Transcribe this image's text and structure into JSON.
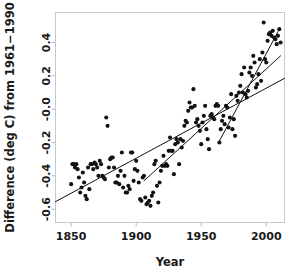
{
  "chart_data": {
    "type": "scatter",
    "title": "",
    "xlabel": "Year",
    "ylabel": "Difference (deg C) from 1961–1990",
    "xlim": [
      1838,
      2014
    ],
    "ylim": [
      -0.68,
      0.58
    ],
    "grid": false,
    "legend": "none",
    "xticks": [
      1850,
      1900,
      1950,
      2000
    ],
    "xtick_labels": [
      "1850",
      "1900",
      "1950",
      "2000"
    ],
    "yticks": [
      -0.6,
      -0.4,
      -0.2,
      -0.0,
      0.2,
      0.4
    ],
    "ytick_labels": [
      "-0.6",
      "-0.4",
      "-0.2",
      "-0.0",
      "0.2",
      "0.4"
    ],
    "point_color": "#121212",
    "line_color": "#121212",
    "series": [
      {
        "name": "Annual temperature anomaly",
        "x": [
          1850,
          1851,
          1852,
          1853,
          1854,
          1855,
          1856,
          1857,
          1858,
          1859,
          1860,
          1861,
          1862,
          1863,
          1864,
          1865,
          1866,
          1867,
          1868,
          1869,
          1870,
          1871,
          1872,
          1873,
          1874,
          1875,
          1876,
          1877,
          1878,
          1879,
          1880,
          1881,
          1882,
          1883,
          1884,
          1885,
          1886,
          1887,
          1888,
          1889,
          1890,
          1891,
          1892,
          1893,
          1894,
          1895,
          1896,
          1897,
          1898,
          1899,
          1900,
          1901,
          1902,
          1903,
          1904,
          1905,
          1906,
          1907,
          1908,
          1909,
          1910,
          1911,
          1912,
          1913,
          1914,
          1915,
          1916,
          1917,
          1918,
          1919,
          1920,
          1921,
          1922,
          1923,
          1924,
          1925,
          1926,
          1927,
          1928,
          1929,
          1930,
          1931,
          1932,
          1933,
          1934,
          1935,
          1936,
          1937,
          1938,
          1939,
          1940,
          1941,
          1942,
          1943,
          1944,
          1945,
          1946,
          1947,
          1948,
          1949,
          1950,
          1951,
          1952,
          1953,
          1954,
          1955,
          1956,
          1957,
          1958,
          1959,
          1960,
          1961,
          1962,
          1963,
          1964,
          1965,
          1966,
          1967,
          1968,
          1969,
          1970,
          1971,
          1972,
          1973,
          1974,
          1975,
          1976,
          1977,
          1978,
          1979,
          1980,
          1981,
          1982,
          1983,
          1984,
          1985,
          1986,
          1987,
          1988,
          1989,
          1990,
          1991,
          1992,
          1993,
          1994,
          1995,
          1996,
          1997,
          1998,
          1999,
          2000,
          2001,
          2002,
          2003,
          2004,
          2005,
          2006,
          2007,
          2008,
          2009,
          2010,
          2011
        ],
        "y": [
          -0.45,
          -0.33,
          -0.33,
          -0.35,
          -0.33,
          -0.36,
          -0.41,
          -0.5,
          -0.47,
          -0.38,
          -0.44,
          -0.52,
          -0.54,
          -0.35,
          -0.48,
          -0.33,
          -0.33,
          -0.36,
          -0.32,
          -0.33,
          -0.35,
          -0.4,
          -0.31,
          -0.33,
          -0.4,
          -0.41,
          -0.42,
          -0.05,
          -0.1,
          -0.35,
          -0.3,
          -0.29,
          -0.29,
          -0.35,
          -0.44,
          -0.44,
          -0.4,
          -0.45,
          -0.37,
          -0.26,
          -0.47,
          -0.4,
          -0.5,
          -0.5,
          -0.46,
          -0.48,
          -0.26,
          -0.26,
          -0.43,
          -0.36,
          -0.31,
          -0.37,
          -0.44,
          -0.54,
          -0.55,
          -0.41,
          -0.4,
          -0.53,
          -0.57,
          -0.56,
          -0.55,
          -0.58,
          -0.52,
          -0.5,
          -0.33,
          -0.31,
          -0.46,
          -0.56,
          -0.44,
          -0.37,
          -0.34,
          -0.28,
          -0.34,
          -0.33,
          -0.34,
          -0.25,
          -0.17,
          -0.25,
          -0.25,
          -0.39,
          -0.21,
          -0.18,
          -0.2,
          -0.33,
          -0.18,
          -0.23,
          -0.19,
          -0.1,
          -0.07,
          -0.08,
          -0.01,
          0.04,
          0.01,
          0.01,
          0.12,
          0.02,
          -0.08,
          -0.06,
          -0.1,
          -0.13,
          -0.21,
          -0.08,
          -0.04,
          0.02,
          -0.12,
          -0.18,
          -0.24,
          -0.04,
          -0.03,
          -0.05,
          -0.06,
          0.02,
          0.03,
          0.02,
          -0.2,
          -0.12,
          -0.07,
          -0.04,
          -0.09,
          0.02,
          0.01,
          -0.11,
          -0.05,
          0.09,
          -0.12,
          -0.06,
          -0.16,
          0.08,
          0.05,
          0.1,
          0.14,
          0.21,
          0.1,
          0.25,
          0.09,
          0.07,
          0.11,
          0.22,
          0.25,
          0.2,
          0.32,
          0.28,
          0.13,
          0.15,
          0.21,
          0.3,
          0.17,
          0.34,
          0.52,
          0.3,
          0.28,
          0.41,
          0.45,
          0.46,
          0.44,
          0.47,
          0.43,
          0.42,
          0.39,
          0.44,
          0.48,
          0.4
        ]
      }
    ],
    "trend_lines": [
      {
        "name": "150-year trend (1856-2005)",
        "period": "1856–2005",
        "x": [
          1838,
          2014
        ],
        "y": [
          -0.555,
          0.185
        ],
        "slope_per_century": 0.42
      },
      {
        "name": "100-year trend (1906-2005)",
        "period": "1906–2005",
        "x": [
          1906,
          2011
        ],
        "y": [
          -0.43,
          0.32
        ],
        "slope_per_century": 0.71
      },
      {
        "name": "50-year trend (1963-2010)",
        "period": "1963–2010",
        "x": [
          1963,
          2009
        ],
        "y": [
          -0.205,
          0.465
        ],
        "slope_per_century": 1.45
      }
    ]
  },
  "figure": {
    "ylabel": "Difference (deg C) from 1961−1990",
    "xlabel": "Year"
  }
}
